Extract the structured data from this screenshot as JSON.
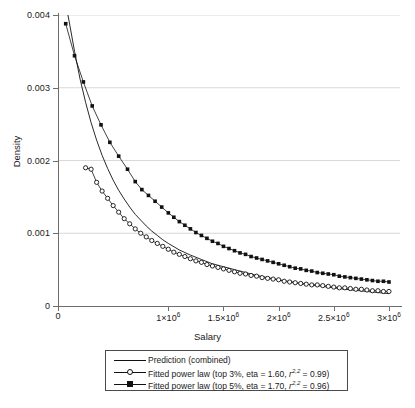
{
  "chart_data": {
    "type": "line",
    "title": "",
    "xlabel": "Salary",
    "ylabel": "Density",
    "xlim": [
      0,
      3100000
    ],
    "ylim": [
      0,
      0.004
    ],
    "grid": true,
    "legend_position": "below-axes",
    "y_ticks": [
      {
        "value": 0,
        "label": "0"
      },
      {
        "value": 0.001,
        "label": "0.001"
      },
      {
        "value": 0.002,
        "label": "0.002"
      },
      {
        "value": 0.003,
        "label": "0.003"
      },
      {
        "value": 0.004,
        "label": "0.004"
      }
    ],
    "x_ticks": [
      {
        "value": 0,
        "label": "0",
        "mantissa": "0",
        "exp": ""
      },
      {
        "value": 1000000,
        "label": "1×10⁶",
        "mantissa": "1×10",
        "exp": "6"
      },
      {
        "value": 1500000,
        "label": "1.5×10⁶",
        "mantissa": "1.5×10",
        "exp": "6"
      },
      {
        "value": 2000000,
        "label": "2×10⁶",
        "mantissa": "2×10",
        "exp": "6"
      },
      {
        "value": 2500000,
        "label": "2.5×10⁶",
        "mantissa": "2.5×10",
        "exp": "6"
      },
      {
        "value": 3000000,
        "label": "3×10⁶",
        "mantissa": "3×10",
        "exp": "6"
      }
    ],
    "series": [
      {
        "name": "Prediction (combined)",
        "style": "line",
        "marker": "none",
        "color": "#111111",
        "x": [
          70000,
          100000,
          150000,
          200000,
          250000,
          300000,
          350000,
          400000,
          450000,
          500000,
          550000,
          600000,
          650000,
          700000,
          750000,
          800000,
          850000,
          900000,
          950000,
          1000000,
          1100000,
          1200000,
          1300000,
          1400000,
          1500000,
          1600000,
          1800000,
          2000000,
          2200000,
          2400000,
          2600000,
          2800000,
          3000000
        ],
        "y": [
          0.00415,
          0.00392,
          0.0035,
          0.00312,
          0.0028,
          0.00252,
          0.00228,
          0.00207,
          0.00189,
          0.00173,
          0.00159,
          0.00147,
          0.00136,
          0.00126,
          0.00118,
          0.0011,
          0.00103,
          0.00097,
          0.00091,
          0.00086,
          0.00077,
          0.0007,
          0.00064,
          0.00058,
          0.00054,
          0.0005,
          0.00042,
          0.00036,
          0.00031,
          0.00027,
          0.00023,
          0.0002,
          0.00017
        ]
      },
      {
        "name": "Fitted power law (top 3%, eta = 1.60, r^2,2 = 0.99)",
        "label_prefix": "Fitted power law (top 3%, eta = 1.60, ",
        "label_var": "r",
        "label_sup": "2,2",
        "label_suffix": " = 0.99)",
        "eta": 1.6,
        "r2": 0.99,
        "top_pct": "3%",
        "style": "line+marker",
        "marker": "open-square",
        "color": "#111111",
        "x": [
          250000,
          300000,
          350000,
          400000,
          450000,
          500000,
          550000,
          600000,
          650000,
          700000,
          750000,
          800000,
          850000,
          900000,
          950000,
          1000000,
          1050000,
          1100000,
          1150000,
          1200000,
          1250000,
          1300000,
          1350000,
          1400000,
          1450000,
          1500000,
          1550000,
          1600000,
          1650000,
          1700000,
          1750000,
          1800000,
          1850000,
          1900000,
          1950000,
          2000000,
          2050000,
          2100000,
          2150000,
          2200000,
          2250000,
          2300000,
          2350000,
          2400000,
          2450000,
          2500000,
          2550000,
          2600000,
          2650000,
          2700000,
          2750000,
          2800000,
          2850000,
          2900000,
          2950000,
          3000000
        ],
        "y": [
          0.0019,
          0.00188,
          0.0017,
          0.00158,
          0.00148,
          0.00138,
          0.00129,
          0.0012,
          0.00113,
          0.00106,
          0.001,
          0.00095,
          0.0009,
          0.00086,
          0.00082,
          0.00078,
          0.00074,
          0.00071,
          0.00068,
          0.00065,
          0.00062,
          0.0006,
          0.00057,
          0.00055,
          0.00053,
          0.00051,
          0.00049,
          0.00047,
          0.00045,
          0.00044,
          0.00042,
          0.00041,
          0.00039,
          0.00038,
          0.00037,
          0.00036,
          0.00034,
          0.00033,
          0.00032,
          0.00031,
          0.0003,
          0.00029,
          0.00029,
          0.00028,
          0.00027,
          0.00026,
          0.00025,
          0.00025,
          0.00024,
          0.00023,
          0.00023,
          0.00022,
          0.00021,
          0.00021,
          0.0002,
          0.0002
        ]
      },
      {
        "name": "Fitted power law (top 5%, eta = 1.70, r^2,2 = 0.96)",
        "label_prefix": "Fitted power law (top 5%, eta = 1.70, ",
        "label_var": "r",
        "label_sup": "2,2",
        "label_suffix": " = 0.96)",
        "eta": 1.7,
        "r2": 0.96,
        "top_pct": "5%",
        "style": "line+marker",
        "marker": "filled-square",
        "color": "#111111",
        "x": [
          70000,
          150000,
          230000,
          310000,
          390000,
          470000,
          550000,
          630000,
          700000,
          760000,
          820000,
          880000,
          940000,
          1000000,
          1050000,
          1100000,
          1150000,
          1200000,
          1250000,
          1300000,
          1350000,
          1400000,
          1450000,
          1500000,
          1550000,
          1600000,
          1650000,
          1700000,
          1750000,
          1800000,
          1850000,
          1900000,
          1950000,
          2000000,
          2050000,
          2100000,
          2150000,
          2200000,
          2250000,
          2300000,
          2350000,
          2400000,
          2450000,
          2500000,
          2550000,
          2600000,
          2650000,
          2700000,
          2750000,
          2800000,
          2850000,
          2900000,
          2950000,
          3000000
        ],
        "y": [
          0.00388,
          0.00344,
          0.00308,
          0.00275,
          0.00249,
          0.00225,
          0.00206,
          0.00188,
          0.00171,
          0.0016,
          0.00152,
          0.00144,
          0.00136,
          0.00128,
          0.00122,
          0.00116,
          0.00111,
          0.00106,
          0.00101,
          0.00097,
          0.00093,
          0.00089,
          0.00086,
          0.00082,
          0.00079,
          0.00076,
          0.00073,
          0.00071,
          0.00068,
          0.00066,
          0.00064,
          0.00062,
          0.0006,
          0.00058,
          0.00056,
          0.00054,
          0.00052,
          0.00051,
          0.00049,
          0.00048,
          0.00046,
          0.00045,
          0.00044,
          0.00043,
          0.00041,
          0.0004,
          0.00039,
          0.00038,
          0.00037,
          0.00036,
          0.00035,
          0.00034,
          0.00034,
          0.00033
        ]
      }
    ]
  },
  "legend": {
    "entries": [
      {
        "text": "Prediction (combined)",
        "marker": "none"
      },
      {
        "text": "Fitted power law (top 3%, eta = 1.60, ",
        "var": "r",
        "sup": "2,2",
        "tail": " = 0.99)",
        "marker": "open-square"
      },
      {
        "text": "Fitted power law (top 5%, eta = 1.70, ",
        "var": "r",
        "sup": "2,2",
        "tail": " = 0.96)",
        "marker": "filled-square"
      }
    ]
  },
  "colors": {
    "ink": "#111111",
    "axis": "#6e6e6e",
    "grid": "#d9d9d9",
    "background": "#ffffff"
  }
}
